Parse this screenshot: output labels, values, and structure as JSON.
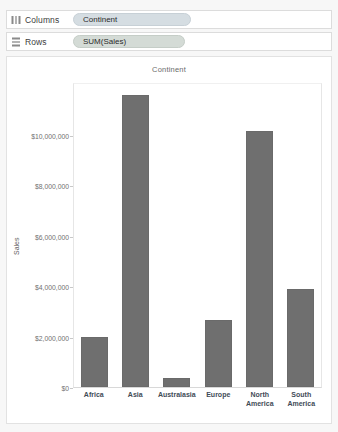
{
  "shelves": [
    {
      "icon": "columns-icon",
      "label": "Columns",
      "pill_label": "Continent",
      "pill_type": "dimension"
    },
    {
      "icon": "rows-icon",
      "label": "Rows",
      "pill_label": "SUM(Sales)",
      "pill_type": "measure"
    }
  ],
  "colors": {
    "bar": "#6f6f6f",
    "dimension_pill": "#d5dde2",
    "measure_pill": "#d4dbd6",
    "panel_background": "#ffffff",
    "app_background": "#f7f7f7",
    "x_label_text": "#3f4b57",
    "tick_text": "#707070"
  },
  "chart_data": {
    "type": "bar",
    "title": "Continent",
    "xlabel": "",
    "ylabel": "Sales",
    "categories": [
      "Africa",
      "Asia",
      "Australasia",
      "Europe",
      "North America",
      "South America"
    ],
    "category_lines": [
      [
        "Africa"
      ],
      [
        "Asia"
      ],
      [
        "Australasia"
      ],
      [
        "Europe"
      ],
      [
        "North",
        "America"
      ],
      [
        "South",
        "America"
      ]
    ],
    "values": [
      2000000,
      11600000,
      340000,
      2650000,
      10150000,
      3900000
    ],
    "ylim": [
      0,
      12100000
    ],
    "yticks": [
      0,
      2000000,
      4000000,
      6000000,
      8000000,
      10000000
    ],
    "ytick_labels": [
      "$0",
      "$2,000,000",
      "$4,000,000",
      "$6,000,000",
      "$8,000,000",
      "$10,000,000"
    ],
    "grid": false,
    "legend": "none",
    "series": [
      {
        "name": "SUM(Sales)",
        "values": [
          2000000,
          11600000,
          340000,
          2650000,
          10150000,
          3900000
        ]
      }
    ]
  }
}
